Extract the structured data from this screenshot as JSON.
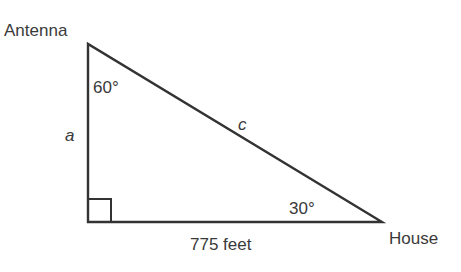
{
  "diagram": {
    "type": "right-triangle",
    "vertices": {
      "top": {
        "label": "Antenna",
        "angle": "60°"
      },
      "bottom_right": {
        "label": "House",
        "angle": "30°"
      },
      "bottom_left": {
        "angle": "right angle"
      }
    },
    "sides": {
      "vertical": {
        "label": "a"
      },
      "hypotenuse": {
        "label": "c"
      },
      "horizontal": {
        "label": "775 feet"
      }
    },
    "colors": {
      "stroke": "#333333",
      "text": "#3a3a3a",
      "background": "#ffffff"
    }
  }
}
